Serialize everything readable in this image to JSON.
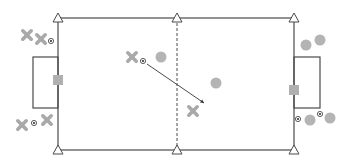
{
  "title": "Soccer drill diagram",
  "colors": {
    "line": "#4a4a4a",
    "player_attacker": "#a9a9a9",
    "player_defender": "#b4b4b4",
    "goal": "#b0b0b0",
    "ball": "#333333",
    "background": "#ffffff"
  },
  "field": {
    "left": 58,
    "right": 294,
    "top": 18,
    "bottom": 150,
    "center_x": 177,
    "center_line_style": "dashed"
  },
  "goal_boxes": [
    {
      "side": "left",
      "x": 33,
      "y": 57,
      "w": 25,
      "h": 51
    },
    {
      "side": "right",
      "x": 294,
      "y": 57,
      "w": 26,
      "h": 51
    }
  ],
  "goals": [
    {
      "side": "left",
      "x": 58,
      "y": 80
    },
    {
      "side": "right",
      "x": 294,
      "y": 90
    }
  ],
  "cones": [
    {
      "x": 58,
      "y": 18
    },
    {
      "x": 177,
      "y": 18
    },
    {
      "x": 294,
      "y": 18
    },
    {
      "x": 58,
      "y": 150
    },
    {
      "x": 177,
      "y": 150
    },
    {
      "x": 294,
      "y": 150
    }
  ],
  "players_x": [
    {
      "x": 27,
      "y": 35
    },
    {
      "x": 41,
      "y": 39
    },
    {
      "x": 22,
      "y": 125
    },
    {
      "x": 47,
      "y": 120
    },
    {
      "x": 132,
      "y": 57
    },
    {
      "x": 193,
      "y": 111
    }
  ],
  "players_o": [
    {
      "x": 161,
      "y": 57
    },
    {
      "x": 216,
      "y": 83
    },
    {
      "x": 306,
      "y": 45
    },
    {
      "x": 320,
      "y": 40
    },
    {
      "x": 310,
      "y": 120
    },
    {
      "x": 330,
      "y": 118
    }
  ],
  "balls": [
    {
      "x": 51,
      "y": 41
    },
    {
      "x": 34,
      "y": 123
    },
    {
      "x": 143,
      "y": 61
    },
    {
      "x": 298,
      "y": 119
    },
    {
      "x": 320,
      "y": 114
    }
  ],
  "pass_arrow": {
    "x1": 147,
    "y1": 64,
    "x2": 204,
    "y2": 103
  }
}
